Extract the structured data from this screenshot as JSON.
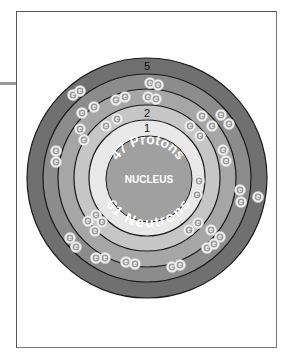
{
  "diagram": {
    "center": {
      "x": 147,
      "y": 178
    },
    "nucleus": {
      "radius": 43,
      "color": "#a0a0a0",
      "label": "NUCLEUS",
      "protons_label": "47 Protons",
      "neutrons_label": "61 Neutrons"
    },
    "shells": [
      {
        "number": "1",
        "radius": 58,
        "color": "#e8e8e8",
        "electrons": 2
      },
      {
        "number": "2",
        "radius": 73,
        "color": "#c6c6c6",
        "electrons": 8
      },
      {
        "number": "3",
        "radius": 89,
        "color": "#a6a6a6",
        "electrons": 18
      },
      {
        "number": "4",
        "radius": 104,
        "color": "#8c8c8c",
        "electrons": 18
      },
      {
        "number": "5",
        "radius": 120,
        "color": "#707070",
        "electrons": 1
      }
    ],
    "electron_label": "e",
    "electron_positions": {
      "shell1": [
        [
          199,
          181
        ],
        [
          197,
          195
        ]
      ],
      "shell2": [
        [
          106,
          126
        ],
        [
          117,
          119
        ],
        [
          190,
          126
        ],
        [
          200,
          136
        ],
        [
          96,
          215
        ],
        [
          102,
          222
        ],
        [
          189,
          230
        ],
        [
          198,
          223
        ]
      ],
      "shell3": [
        [
          82,
          113
        ],
        [
          94,
          107
        ],
        [
          116,
          100
        ],
        [
          125,
          97
        ],
        [
          148,
          97
        ],
        [
          156,
          99
        ],
        [
          202,
          116
        ],
        [
          212,
          126
        ],
        [
          80,
          129
        ],
        [
          84,
          140
        ],
        [
          223,
          150
        ],
        [
          226,
          161
        ],
        [
          88,
          221
        ],
        [
          95,
          231
        ],
        [
          211,
          230
        ],
        [
          220,
          237
        ],
        [
          207,
          248
        ],
        [
          214,
          244
        ]
      ],
      "shell4": [
        [
          73,
          95
        ],
        [
          80,
          91
        ],
        [
          150,
          83
        ],
        [
          158,
          85
        ],
        [
          221,
          115
        ],
        [
          229,
          124
        ],
        [
          56,
          151
        ],
        [
          56,
          162
        ],
        [
          240,
          190
        ],
        [
          241,
          202
        ],
        [
          70,
          238
        ],
        [
          76,
          247
        ],
        [
          96,
          258
        ],
        [
          105,
          258
        ],
        [
          126,
          262
        ],
        [
          135,
          264
        ],
        [
          172,
          267
        ],
        [
          180,
          265
        ]
      ],
      "shell5": [
        [
          258,
          197
        ]
      ]
    }
  }
}
